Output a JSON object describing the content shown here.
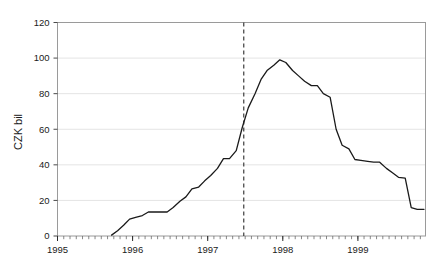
{
  "chart_data": {
    "type": "line",
    "title": "",
    "subtitle": "",
    "xlabel": "",
    "ylabel": "CZK bil",
    "xlim": [
      1995.0,
      1999.9
    ],
    "ylim": [
      0,
      120
    ],
    "grid": true,
    "legend": null,
    "y_ticks": [
      0,
      20,
      40,
      60,
      80,
      100,
      120
    ],
    "y_tick_labels": [
      "0",
      "20",
      "40",
      "60",
      "80",
      "100",
      "120"
    ],
    "x_ticks": [
      1995,
      1996,
      1997,
      1998,
      1999
    ],
    "x_tick_labels": [
      "1995",
      "1996",
      "1997",
      "1998",
      "1999"
    ],
    "x_minor_tick_interval": 0.0833,
    "series": [
      {
        "name": "CZK bil",
        "color": "#1a1a1a",
        "x": [
          1995.72,
          1995.8,
          1995.88,
          1995.96,
          1996.04,
          1996.13,
          1996.21,
          1996.29,
          1996.38,
          1996.46,
          1996.54,
          1996.63,
          1996.71,
          1996.79,
          1996.88,
          1996.96,
          1997.04,
          1997.13,
          1997.21,
          1997.29,
          1997.38,
          1997.46,
          1997.54,
          1997.63,
          1997.71,
          1997.79,
          1997.88,
          1997.96,
          1998.04,
          1998.13,
          1998.21,
          1998.29,
          1998.38,
          1998.46,
          1998.54,
          1998.63,
          1998.71,
          1998.79,
          1998.88,
          1998.96,
          1999.04,
          1999.13,
          1999.21,
          1999.29,
          1999.38,
          1999.46,
          1999.54,
          1999.63,
          1999.71,
          1999.79,
          1999.88
        ],
        "y": [
          0.5,
          3.0,
          6.0,
          9.5,
          10.5,
          11.5,
          13.5,
          13.5,
          13.5,
          13.5,
          16.0,
          19.5,
          22.0,
          26.5,
          27.5,
          31.0,
          34.0,
          38.0,
          43.5,
          43.5,
          48.0,
          61.0,
          72.0,
          80.0,
          88.0,
          93.0,
          96.0,
          99.0,
          97.5,
          93.0,
          90.0,
          87.0,
          84.5,
          84.5,
          80.0,
          78.0,
          60.0,
          51.0,
          49.0,
          43.0,
          42.5,
          42.0,
          41.5,
          41.5,
          38.0,
          35.5,
          33.0,
          32.5,
          16.0,
          15.0,
          15.0
        ]
      }
    ],
    "annotations": [
      {
        "type": "vline",
        "name": "reference-line",
        "x": 1997.48,
        "style": "dashed",
        "color": "#3c3c3c",
        "label": ""
      }
    ]
  }
}
